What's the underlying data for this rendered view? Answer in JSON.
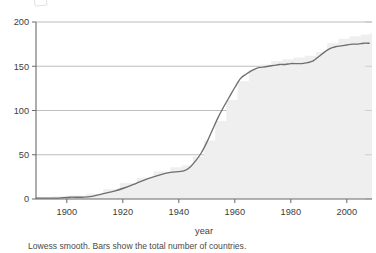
{
  "figure": {
    "caption": "Lowess smooth. Bars show the total number of countries.",
    "axis_title_x": "year",
    "axis_title_y": ""
  },
  "colors": {
    "line": "#6f6f6f",
    "grid": "#9a9a9a",
    "axis": "#6a6a6a",
    "bars": "#ededed",
    "text": "#3d3d3d",
    "background": "#ffffff"
  },
  "chart_data": {
    "type": "line",
    "title": "",
    "subtitle": "",
    "xlabel": "year",
    "ylabel": "",
    "annotation": "Lowess smooth. Bars show the total number of countries.",
    "grid": true,
    "grid_axis": "y",
    "legend": false,
    "legend_position": "none",
    "xlim": [
      1889,
      2009
    ],
    "ylim": [
      0,
      200
    ],
    "xticks": [
      1900,
      1920,
      1940,
      1960,
      1980,
      2000
    ],
    "xtick_labels": [
      "1900",
      "1920",
      "1940",
      "1960",
      "1980",
      "2000"
    ],
    "yticks": [
      0,
      50,
      100,
      150,
      200
    ],
    "ytick_labels": [
      "0",
      "50",
      "100",
      "150",
      "200"
    ],
    "series": [
      {
        "name": "Lowess smooth",
        "style": "line",
        "x": [
          1889,
          1893,
          1897,
          1901,
          1905,
          1909,
          1913,
          1917,
          1921,
          1925,
          1929,
          1933,
          1937,
          1940,
          1942,
          1944,
          1946,
          1948,
          1950,
          1952,
          1954,
          1956,
          1958,
          1960,
          1962,
          1964,
          1966,
          1968,
          1970,
          1972,
          1974,
          1976,
          1978,
          1980,
          1982,
          1984,
          1986,
          1988,
          1990,
          1992,
          1994,
          1996,
          1998,
          2000,
          2002,
          2004,
          2006,
          2008
        ],
        "y": [
          1,
          1,
          1,
          2,
          2,
          3,
          6,
          9,
          13,
          18,
          23,
          27,
          30,
          31,
          32,
          36,
          43,
          52,
          64,
          78,
          92,
          104,
          115,
          126,
          136,
          141,
          145,
          148,
          149,
          150,
          151,
          152,
          152,
          153,
          153,
          153,
          154,
          156,
          161,
          166,
          170,
          172,
          173,
          174,
          175,
          175,
          176,
          176
        ]
      },
      {
        "name": "Total number of countries (bars)",
        "style": "bar",
        "x": [
          1889,
          1895,
          1901,
          1907,
          1913,
          1919,
          1925,
          1931,
          1937,
          1941,
          1945,
          1949,
          1953,
          1957,
          1961,
          1965,
          1969,
          1973,
          1977,
          1981,
          1985,
          1989,
          1993,
          1997,
          2001,
          2005,
          2008
        ],
        "y": [
          2,
          3,
          4,
          6,
          11,
          18,
          24,
          31,
          36,
          38,
          48,
          66,
          88,
          112,
          133,
          146,
          152,
          156,
          158,
          160,
          162,
          166,
          176,
          181,
          184,
          186,
          187
        ]
      }
    ]
  }
}
